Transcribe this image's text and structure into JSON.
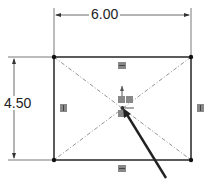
{
  "sketch": {
    "width_dimension": "6.00",
    "height_dimension": "4.50",
    "relations": {
      "top": "horizontal",
      "bottom": "horizontal",
      "left": "vertical",
      "right": "vertical",
      "center": "coincident"
    },
    "colors": {
      "line": "#333333",
      "construction": "#777777",
      "relation_icon": "#888888"
    }
  }
}
